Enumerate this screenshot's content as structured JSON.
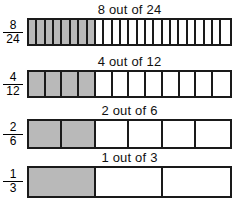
{
  "diagram": {
    "title_visible": false,
    "background_color": "#ffffff",
    "shaded_color": "#b9b9b9",
    "unshaded_color": "#ffffff",
    "border_color": "#1a1a1a",
    "rows": [
      {
        "title": "8 out of 24",
        "numerator": "8",
        "denominator": "24",
        "shaded": 8,
        "total": 24,
        "top": 18,
        "title_top": 3,
        "height": 28,
        "label_top": 20
      },
      {
        "title": "4 out of 12",
        "numerator": "4",
        "denominator": "12",
        "shaded": 4,
        "total": 12,
        "top": 70,
        "title_top": 55,
        "height": 28,
        "label_top": 72
      },
      {
        "title": "2 out of 6",
        "numerator": "2",
        "denominator": "6",
        "shaded": 2,
        "total": 6,
        "top": 119,
        "title_top": 104,
        "height": 30,
        "label_top": 122
      },
      {
        "title": "1 out of 3",
        "numerator": "1",
        "denominator": "3",
        "shaded": 1,
        "total": 3,
        "top": 166,
        "title_top": 151,
        "height": 32,
        "label_top": 169
      }
    ]
  },
  "chart_data": {
    "type": "bar",
    "xlabel": "",
    "ylabel": "",
    "categories": [
      "8 out of 24",
      "4 out of 12",
      "2 out of 6",
      "1 out of 3"
    ],
    "series": [
      {
        "name": "shaded parts",
        "values": [
          8,
          4,
          2,
          1
        ]
      },
      {
        "name": "total parts",
        "values": [
          24,
          12,
          6,
          3
        ]
      },
      {
        "name": "fraction value",
        "values": [
          0.3333,
          0.3333,
          0.3333,
          0.3333
        ]
      }
    ],
    "annotations": [
      "8/24",
      "4/12",
      "2/6",
      "1/3"
    ],
    "grid": false,
    "legend": "none"
  }
}
